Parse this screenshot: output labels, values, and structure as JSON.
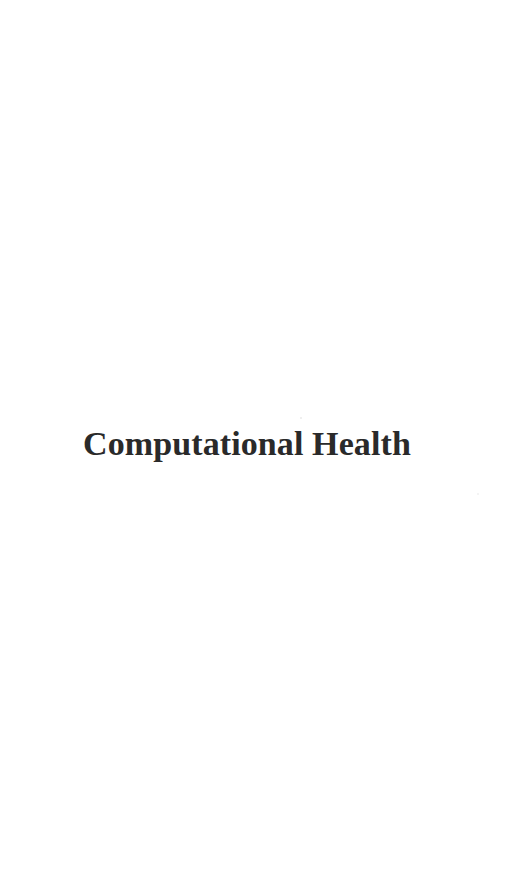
{
  "page": {
    "background_color": "#ffffff",
    "width": 514,
    "height": 881,
    "kind": "scanned-book-section-divider"
  },
  "title": {
    "text": "Computational Health",
    "color": "#2a2a2a",
    "weight": "bold",
    "style": "serif"
  },
  "artifacts": {
    "speck_above_title": "",
    "speck_lower_right": ""
  }
}
